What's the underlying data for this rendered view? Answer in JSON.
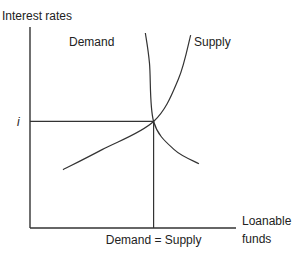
{
  "chart_data": {
    "type": "line",
    "title": "",
    "ylabel": "Interest rates",
    "xlabel": "Loanable funds",
    "xlabel_lines": [
      "Loanable",
      "funds"
    ],
    "ytick_label": "i",
    "xtick_label": "Demand = Supply",
    "xlim": [
      0,
      10
    ],
    "ylim": [
      0,
      10
    ],
    "grid": false,
    "equilibrium": {
      "x": 6,
      "y": 5.3
    },
    "series": [
      {
        "name": "Demand",
        "label": "Demand",
        "points": [
          [
            5.6,
            9.7
          ],
          [
            5.8,
            8.2
          ],
          [
            6.0,
            5.3
          ],
          [
            7.0,
            3.9
          ],
          [
            8.2,
            3.2
          ]
        ]
      },
      {
        "name": "Supply",
        "label": "Supply",
        "points": [
          [
            1.6,
            2.9
          ],
          [
            3.5,
            3.9
          ],
          [
            6.0,
            5.3
          ],
          [
            7.2,
            7.4
          ],
          [
            7.8,
            9.6
          ]
        ]
      }
    ]
  }
}
